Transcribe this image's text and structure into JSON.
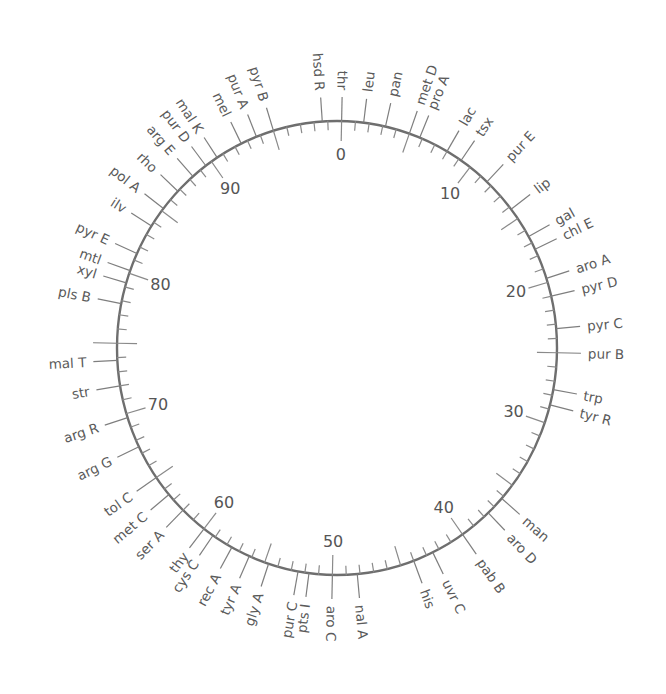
{
  "diagram": {
    "type": "circular genetic map",
    "unit": "minutes",
    "total_minutes": 100,
    "scale_label_interval": 10,
    "medium_tick_interval": 5,
    "minor_tick_interval": 1,
    "scale_labels": [
      "0",
      "10",
      "20",
      "30",
      "40",
      "50",
      "60",
      "70",
      "80",
      "90"
    ],
    "genes": [
      {
        "name": "thr",
        "position": 0
      },
      {
        "name": "leu",
        "position": 1.6
      },
      {
        "name": "pan",
        "position": 3.2
      },
      {
        "name": "met D",
        "position": 5
      },
      {
        "name": "pro A",
        "position": 5.8
      },
      {
        "name": "lac",
        "position": 8
      },
      {
        "name": "tsx",
        "position": 9.2
      },
      {
        "name": "pur E",
        "position": 11.6
      },
      {
        "name": "lip",
        "position": 14.2
      },
      {
        "name": "gal",
        "position": 16.5
      },
      {
        "name": "chl E",
        "position": 17.5
      },
      {
        "name": "aro A",
        "position": 19.7
      },
      {
        "name": "pyr D",
        "position": 21
      },
      {
        "name": "pyr C",
        "position": 23.3
      },
      {
        "name": "pur B",
        "position": 25
      },
      {
        "name": "trp",
        "position": 27.6
      },
      {
        "name": "tyr R",
        "position": 28.7
      },
      {
        "name": "man",
        "position": 36.2
      },
      {
        "name": "aro D",
        "position": 37.6
      },
      {
        "name": "pab B",
        "position": 40
      },
      {
        "name": "uvr C",
        "position": 42.5
      },
      {
        "name": "his",
        "position": 44
      },
      {
        "name": "nal A",
        "position": 48.2
      },
      {
        "name": "aro C",
        "position": 50
      },
      {
        "name": "pts I",
        "position": 51.7
      },
      {
        "name": "pur C",
        "position": 52.5
      },
      {
        "name": "gly A",
        "position": 54.7
      },
      {
        "name": "tyr A",
        "position": 56.2
      },
      {
        "name": "rec A",
        "position": 57.6
      },
      {
        "name": "cys C",
        "position": 59.2
      },
      {
        "name": "thy",
        "position": 60
      },
      {
        "name": "ser A",
        "position": 62
      },
      {
        "name": "met C",
        "position": 63.5
      },
      {
        "name": "tol C",
        "position": 65
      },
      {
        "name": "arg G",
        "position": 67.5
      },
      {
        "name": "arg R",
        "position": 69.7
      },
      {
        "name": "str",
        "position": 72
      },
      {
        "name": "mal T",
        "position": 73.8
      },
      {
        "name": "pls B",
        "position": 77.8
      },
      {
        "name": "xyl",
        "position": 79.3
      },
      {
        "name": "mtl",
        "position": 80.2
      },
      {
        "name": "pyr E",
        "position": 81.5
      },
      {
        "name": "ilv",
        "position": 83.7
      },
      {
        "name": "pol A",
        "position": 85.2
      },
      {
        "name": "rho",
        "position": 86.8
      },
      {
        "name": "arg E",
        "position": 88.3
      },
      {
        "name": "pur D",
        "position": 89.5
      },
      {
        "name": "mal K",
        "position": 90.5
      },
      {
        "name": "mel",
        "position": 92.5
      },
      {
        "name": "pur A",
        "position": 93.7
      },
      {
        "name": "pyr B",
        "position": 95
      },
      {
        "name": "hsd R",
        "position": 98.6
      }
    ],
    "unlabeled_markers": [
      75
    ]
  },
  "colors": {
    "background": "#ffffff",
    "circle": "#6e6e6e",
    "ticks": "#8a8a8a",
    "gene_lines": "#7e7e7e",
    "gene_text": "#5a5a5a",
    "number_text": "#555555"
  }
}
